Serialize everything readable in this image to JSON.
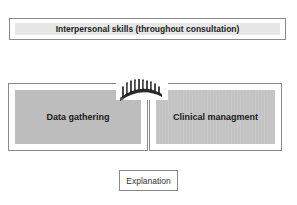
{
  "diagram": {
    "top": {
      "label": "Interpersonal skills (throughout consultation)"
    },
    "left": {
      "label": "Data gathering"
    },
    "right": {
      "label": "Clinical managment"
    },
    "connector": {
      "icon": "bridge-icon"
    },
    "bottom": {
      "label": "Explanation"
    },
    "colors": {
      "border": "#8a8a8a",
      "top_fill": "#e6e6e6",
      "box_fill": "#bdbdbd",
      "text": "#222222"
    }
  }
}
